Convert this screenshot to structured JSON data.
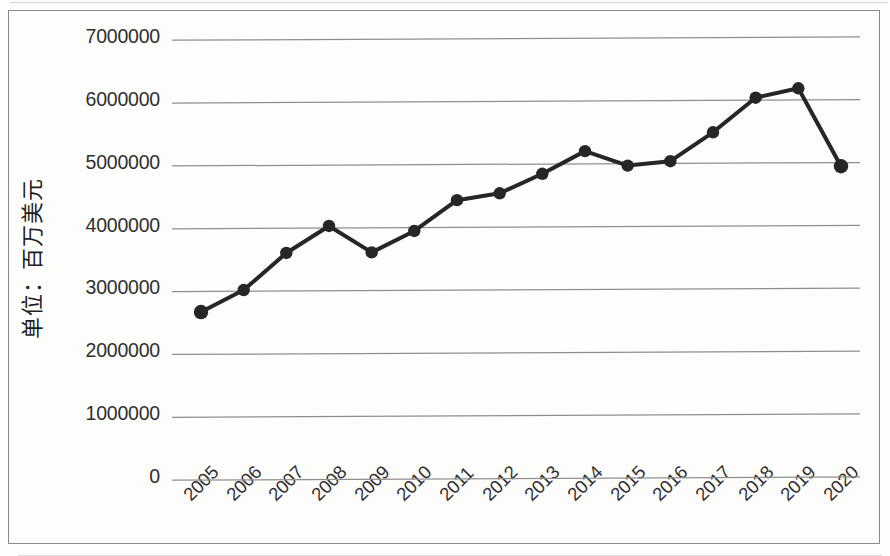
{
  "figure": {
    "background_color": "#fdfdfc",
    "frame_color": "#8a8a8a",
    "series_color": "#262626",
    "gridline_color": "#8f8f8f",
    "text_color": "#2f2f2f"
  },
  "chart_data": {
    "type": "line",
    "title": "",
    "subtitle": "",
    "xlabel": "",
    "ylabel": "单位：百万美元",
    "categories": [
      "2005",
      "2006",
      "2007",
      "2008",
      "2009",
      "2010",
      "2011",
      "2012",
      "2013",
      "2014",
      "2015",
      "2016",
      "2017",
      "2018",
      "2019",
      "2020"
    ],
    "values": [
      2640000,
      2990000,
      3580000,
      4010000,
      3590000,
      3930000,
      4420000,
      4530000,
      4840000,
      5200000,
      4970000,
      5040000,
      5500000,
      6050000,
      6200000,
      4960000
    ],
    "ylim": [
      0,
      7000000
    ],
    "ytick_labels": [
      "7000000",
      "6000000",
      "5000000",
      "4000000",
      "3000000",
      "2000000",
      "1000000",
      "0"
    ],
    "ytick_values": [
      7000000,
      6000000,
      5000000,
      4000000,
      3000000,
      2000000,
      1000000,
      0
    ],
    "grid": true,
    "grid_axis": "y",
    "legend": false,
    "legend_position": "none",
    "markers": true,
    "marker_shape": "circle",
    "line_width": 4
  }
}
